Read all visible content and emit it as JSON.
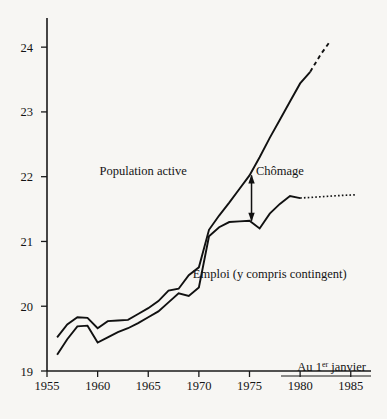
{
  "figure": {
    "background_color": "#f7f6f3",
    "ink_color": "#111111",
    "note": {
      "prefix": "Au 1",
      "superscript": "er",
      "suffix": " janvier"
    }
  },
  "chart_data": {
    "type": "line",
    "title": "",
    "subtitle": "",
    "xlabel": "",
    "ylabel": "",
    "xlim": [
      1955,
      1987
    ],
    "ylim": [
      19,
      24.45
    ],
    "grid": false,
    "legend_position": "inline-annotations",
    "x_ticks": [
      1955,
      1960,
      1965,
      1970,
      1975,
      1980,
      1985
    ],
    "y_ticks": [
      19,
      20,
      21,
      22,
      23,
      24
    ],
    "annotations": [
      {
        "name": "population-active",
        "text": "Population active",
        "x": 1964.5,
        "y": 22.03
      },
      {
        "name": "chomage",
        "text": "Chômage",
        "x": 1978.0,
        "y": 22.03
      },
      {
        "name": "emploi",
        "text": "Emploi (y compris contingent)",
        "x": 1977.0,
        "y": 20.44
      },
      {
        "name": "gap-arrow",
        "text": "",
        "x": 1975.2,
        "y_top": 22.02,
        "y_bottom": 21.32
      }
    ],
    "series": [
      {
        "name": "Population active",
        "style": "solid",
        "x": [
          1956,
          1957,
          1958,
          1959,
          1960,
          1961,
          1962,
          1963,
          1964,
          1965,
          1966,
          1967,
          1968,
          1969,
          1970,
          1971,
          1972,
          1973,
          1974,
          1975,
          1976,
          1977,
          1978,
          1979,
          1980,
          1981
        ],
        "values": [
          19.52,
          19.72,
          19.83,
          19.82,
          19.66,
          19.77,
          19.78,
          19.79,
          19.88,
          19.97,
          20.08,
          20.24,
          20.27,
          20.48,
          20.6,
          21.18,
          21.4,
          21.6,
          21.81,
          22.02,
          22.3,
          22.6,
          22.88,
          23.16,
          23.44,
          23.62
        ],
        "projection": {
          "style": "dashed",
          "x": [
            1981,
            1982,
            1983
          ],
          "values": [
            23.62,
            23.88,
            24.1
          ]
        }
      },
      {
        "name": "Emploi (y compris contingent)",
        "style": "solid",
        "x": [
          1956,
          1957,
          1958,
          1959,
          1960,
          1961,
          1962,
          1963,
          1964,
          1965,
          1966,
          1967,
          1968,
          1969,
          1970,
          1971,
          1972,
          1973,
          1974,
          1975,
          1976,
          1977,
          1978,
          1979,
          1980
        ],
        "values": [
          19.25,
          19.49,
          19.69,
          19.7,
          19.44,
          19.52,
          19.6,
          19.66,
          19.74,
          19.83,
          19.92,
          20.06,
          20.2,
          20.16,
          20.29,
          21.08,
          21.22,
          21.3,
          21.31,
          21.32,
          21.2,
          21.43,
          21.58,
          21.7,
          21.67
        ],
        "projection": {
          "style": "dotted",
          "x": [
            1980,
            1982,
            1984,
            1985.4
          ],
          "values": [
            21.67,
            21.69,
            21.71,
            21.72
          ]
        }
      }
    ]
  }
}
